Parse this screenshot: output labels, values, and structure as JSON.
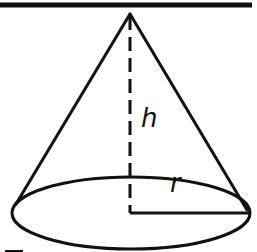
{
  "diagram": {
    "type": "cone",
    "labels": {
      "height": "h",
      "radius": "r"
    },
    "colors": {
      "stroke": "#111111",
      "background": "#ffffff"
    }
  }
}
